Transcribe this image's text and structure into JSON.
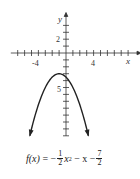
{
  "chart_data": {
    "type": "line",
    "title": "",
    "function": "f(x) = -1/2 x^2 - x - 7/2",
    "xlabel": "x",
    "ylabel": "y",
    "xlim": [
      -8,
      10
    ],
    "ylim": [
      -12,
      5
    ],
    "x_tick_labels": [
      {
        "value": -4,
        "label": "-4"
      },
      {
        "value": 4,
        "label": "4"
      }
    ],
    "y_tick_labels": [
      {
        "value": 2,
        "label": "2"
      },
      {
        "value": -5,
        "label": "5"
      }
    ],
    "tick_interval": 1,
    "grid": false,
    "vertex": [
      -1,
      -3
    ],
    "curve_color": "#222222",
    "end_arrows": true,
    "x_range_plotted": [
      -5.24,
      3.24
    ]
  },
  "labels": {
    "x_axis": "x",
    "y_axis": "y",
    "tick_neg4": "-4",
    "tick_4": "4",
    "tick_2": "2",
    "tick_5": "5"
  },
  "formula": {
    "lhs": "f(x)",
    "eq": " = −",
    "frac1_num": "1",
    "frac1_den": "2",
    "x2": "x",
    "exp": "2",
    "mid": " − x −",
    "frac2_num": "7",
    "frac2_den": "2"
  }
}
